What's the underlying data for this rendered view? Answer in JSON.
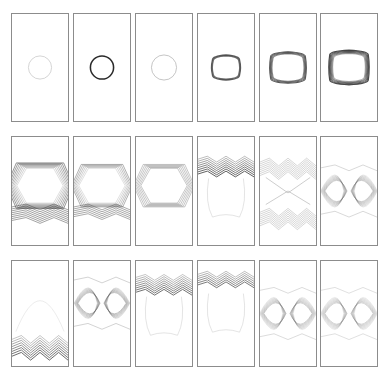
{
  "figure": {
    "layout": {
      "rows": 3,
      "cols": 6,
      "col_x": [
        11,
        73,
        135,
        197,
        259,
        320
      ],
      "row_y": [
        13,
        136,
        260
      ],
      "panel_width": 58,
      "panel_heights": [
        109,
        110,
        107
      ],
      "border_color": "#8c8c8c"
    },
    "panels": [
      {
        "row": 0,
        "col": 0,
        "kind": "circle",
        "r": 12,
        "cy": 0.5,
        "stroke": "#c8c8c8",
        "width": 0.8,
        "layers": 1
      },
      {
        "row": 0,
        "col": 1,
        "kind": "circle",
        "r": 12,
        "cy": 0.5,
        "stroke": "#2a2a2a",
        "width": 1.6,
        "layers": 1
      },
      {
        "row": 0,
        "col": 2,
        "kind": "circle",
        "r": 13,
        "cy": 0.5,
        "stroke": "#b4b4b4",
        "width": 0.8,
        "layers": 1
      },
      {
        "row": 0,
        "col": 3,
        "kind": "rounded-square",
        "r": 14,
        "cy": 0.5,
        "stroke": "#4a4a4a",
        "width": 1.4,
        "layers": 2
      },
      {
        "row": 0,
        "col": 4,
        "kind": "rounded-square",
        "r": 18,
        "cy": 0.5,
        "stroke": "#4a4a4a",
        "width": 1.2,
        "layers": 4
      },
      {
        "row": 0,
        "col": 5,
        "kind": "rounded-square",
        "r": 20,
        "cy": 0.5,
        "stroke": "#3a3a3a",
        "width": 1.2,
        "layers": 6
      },
      {
        "row": 1,
        "col": 0,
        "kind": "hexagon-band",
        "cy": 0.45,
        "band": "bottom",
        "stroke": "#404040",
        "layers": 8
      },
      {
        "row": 1,
        "col": 1,
        "kind": "hexagon-band",
        "cy": 0.45,
        "band": "both",
        "stroke": "#505050",
        "layers": 6
      },
      {
        "row": 1,
        "col": 2,
        "kind": "hexagon-band",
        "cy": 0.45,
        "band": "sides",
        "stroke": "#4a4a4a",
        "layers": 6
      },
      {
        "row": 1,
        "col": 3,
        "kind": "top-band",
        "cy": 0.2,
        "stroke": "#3c3c3c",
        "layers": 8
      },
      {
        "row": 1,
        "col": 4,
        "kind": "x-pattern",
        "cy": 0.5,
        "stroke": "#6a6a6a",
        "layers": 8
      },
      {
        "row": 1,
        "col": 5,
        "kind": "lens-pair",
        "cy": 0.5,
        "stroke": "#707070",
        "layers": 8
      },
      {
        "row": 2,
        "col": 0,
        "kind": "bottom-band",
        "cy": 0.75,
        "stroke": "#3c3c3c",
        "layers": 8
      },
      {
        "row": 2,
        "col": 1,
        "kind": "lens-pair",
        "cy": 0.4,
        "stroke": "#5a5a5a",
        "layers": 7
      },
      {
        "row": 2,
        "col": 2,
        "kind": "top-band",
        "cy": 0.15,
        "stroke": "#505050",
        "layers": 8
      },
      {
        "row": 2,
        "col": 3,
        "kind": "top-band",
        "cy": 0.12,
        "stroke": "#3c3c3c",
        "layers": 6
      },
      {
        "row": 2,
        "col": 4,
        "kind": "lens-pair",
        "cy": 0.5,
        "stroke": "#7a7a7a",
        "layers": 8
      },
      {
        "row": 2,
        "col": 5,
        "kind": "lens-pair",
        "cy": 0.5,
        "stroke": "#8a8a8a",
        "layers": 8
      }
    ]
  }
}
